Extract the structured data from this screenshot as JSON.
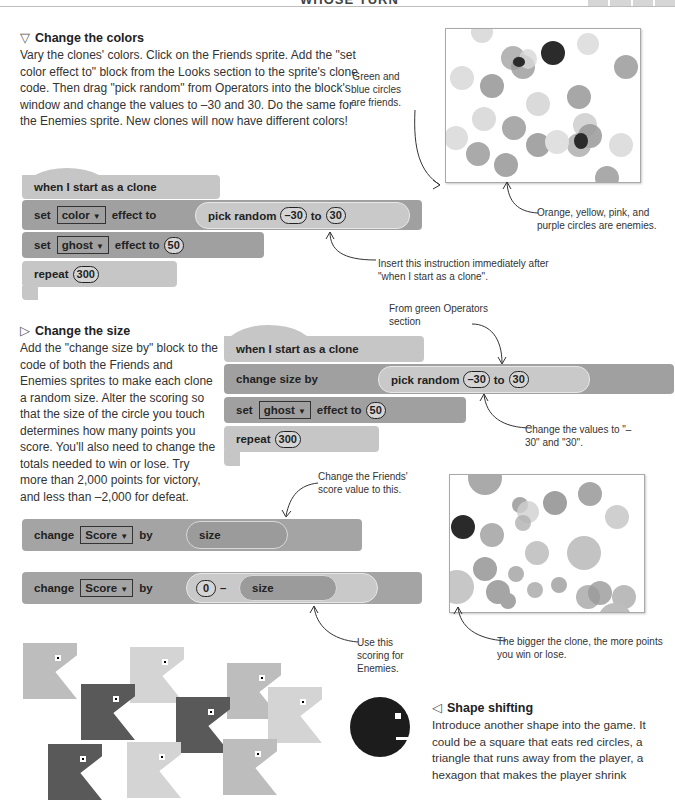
{
  "header": {
    "title": "WHOSE TURN"
  },
  "section_colors": {
    "icon": "down-triangle-icon",
    "heading": "Change the colors",
    "body": "Vary the clones' colors. Click on the Friends sprite. Add the \"set color effect to\" block from the Looks section to the sprite's clone code. Then drag \"pick random\" from Operators into the block's window and change the values to –30 and 30. Do the same for the Enemies sprite. New clones will now have different colors!",
    "annotation_friends": "Green and blue circles are friends.",
    "annotation_enemies": "Orange, yellow, pink, and purple circles are enemies.",
    "annotation_insert": "Insert this instruction immediately after \"when I start as a clone\".",
    "code": {
      "hat": "when I start as a clone",
      "set_color": {
        "prefix": "set",
        "dropdown": "color",
        "suffix": "effect to",
        "op_label": "pick random",
        "from": "–30",
        "to_label": "to",
        "to": "30"
      },
      "set_ghost": {
        "prefix": "set",
        "dropdown": "ghost",
        "suffix": "effect to",
        "value": "50"
      },
      "repeat": {
        "label": "repeat",
        "value": "300"
      }
    }
  },
  "section_size": {
    "icon": "right-triangle-icon",
    "heading": "Change the size",
    "body": "Add the \"change size by\" block to the code of both the Friends and Enemies sprites to make each clone a random size. Alter the scoring so that the size of the circle you touch determines how many points you score. You'll also need to change the totals needed to win or lose. Try more than 2,000 points for victory, and less than –2,000 for defeat.",
    "annotation_operators": "From green Operators section",
    "annotation_values": "Change the values to \"–30\" and \"30\".",
    "annotation_friends_score": "Change the Friends' score value to this.",
    "annotation_enemies_score": "Use this scoring for Enemies.",
    "annotation_bigger": "The bigger the clone, the more points you win or lose.",
    "code": {
      "hat": "when I start as a clone",
      "change_size": {
        "label": "change size by",
        "op_label": "pick random",
        "from": "–30",
        "to_label": "to",
        "to": "30"
      },
      "set_ghost": {
        "prefix": "set",
        "dropdown": "ghost",
        "suffix": "effect to",
        "value": "50"
      },
      "repeat": {
        "label": "repeat",
        "value": "300"
      }
    },
    "score_friends": {
      "prefix": "change",
      "dropdown": "Score",
      "suffix": "by",
      "reporter": "size"
    },
    "score_enemies": {
      "prefix": "change",
      "dropdown": "Score",
      "suffix": "by",
      "left": "0",
      "operator": "–",
      "reporter": "size"
    }
  },
  "section_shape": {
    "icon": "left-triangle-icon",
    "heading": "Shape shifting",
    "body": "Introduce another shape into the game. It could be a square that eats red circles, a triangle that runs away from the player, a hexagon that makes the player shrink"
  }
}
